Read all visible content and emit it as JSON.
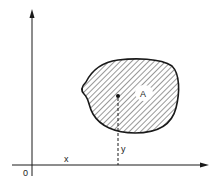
{
  "diagram": {
    "type": "area-centroid",
    "labels": {
      "region": "A",
      "x_coord": "x",
      "y_coord": "y",
      "origin": "0"
    },
    "colors": {
      "line": "#1a1a1a",
      "hatch": "#333333",
      "background": "#ffffff"
    }
  }
}
